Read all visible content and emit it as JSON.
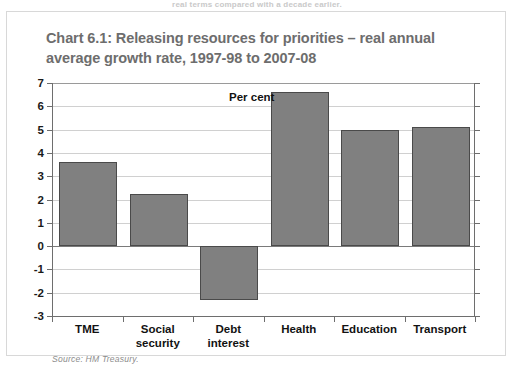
{
  "page_top_text": "real terms compared with a decade earlier.",
  "figure": {
    "title": "Chart 6.1: Releasing resources for priorities – real annual average growth rate, 1997-98 to 2007-08",
    "source": "Source: HM Treasury.",
    "axis_note": "Per cent"
  },
  "colors": {
    "bar_fill": "#808080",
    "bar_border": "#4a4a4a",
    "gridline": "#d0d0d0",
    "axis": "#6e6e6e",
    "title_text": "#6d6d6d",
    "label_text": "#121212",
    "source_text": "#8c8c8c",
    "frame_border": "#d8d8d8"
  },
  "chart_data": {
    "type": "bar",
    "title": "Chart 6.1: Releasing resources for priorities – real annual average growth rate, 1997-98 to 2007-08",
    "xlabel": "",
    "ylabel": "Per cent",
    "categories": [
      "TME",
      "Social security",
      "Debt interest",
      "Health",
      "Education",
      "Transport"
    ],
    "category_lines": [
      [
        "TME"
      ],
      [
        "Social",
        "security"
      ],
      [
        "Debt",
        "interest"
      ],
      [
        "Health"
      ],
      [
        "Education"
      ],
      [
        "Transport"
      ]
    ],
    "values": [
      3.6,
      2.25,
      -2.3,
      6.6,
      5.0,
      5.1
    ],
    "ylim": [
      -3,
      7
    ],
    "yticks": [
      7,
      6,
      5,
      4,
      3,
      2,
      1,
      0,
      -1,
      -2,
      -3
    ],
    "ytick_labels": [
      "7",
      "6",
      "5",
      "4",
      "3",
      "2",
      "1",
      "0",
      "-1",
      "-2",
      "-3"
    ],
    "grid": true,
    "legend": "none",
    "annotations": [
      "Per cent"
    ],
    "source": "Source: HM Treasury."
  }
}
